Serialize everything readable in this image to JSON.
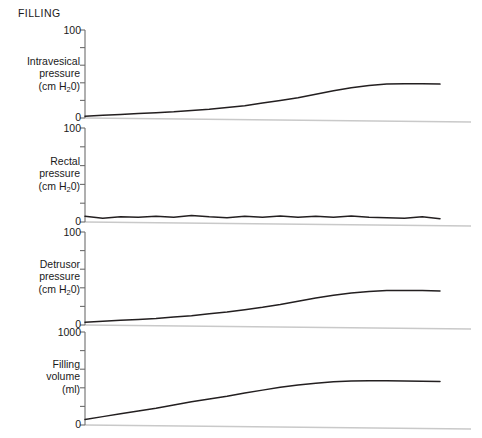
{
  "figure": {
    "phase_title": "FILLING",
    "background": "#ffffff",
    "trace_color": "#231f20",
    "baseline_color": "#c9c9c9",
    "axis_color": "#6d6d6d"
  },
  "panels": [
    {
      "id": "intravesical-pressure",
      "label_lines": [
        "Intravesical",
        "pressure",
        "(cm H₂0)"
      ],
      "unit": "cm H20",
      "axis_max_label": "100",
      "axis_min_label": "0",
      "ymin": 0,
      "ymax": 100,
      "ticks": [
        0,
        20,
        40,
        60,
        80,
        100
      ]
    },
    {
      "id": "rectal-pressure",
      "label_lines": [
        "Rectal",
        "pressure",
        "(cm H₂0)"
      ],
      "unit": "cm H20",
      "axis_max_label": "100",
      "axis_min_label": "0",
      "ymin": 0,
      "ymax": 100,
      "ticks": [
        0,
        20,
        40,
        60,
        80,
        100
      ]
    },
    {
      "id": "detrusor-pressure",
      "label_lines": [
        "Detrusor",
        "pressure",
        "(cm H₂0)"
      ],
      "unit": "cm H20",
      "axis_max_label": "100",
      "axis_min_label": "0",
      "ymin": 0,
      "ymax": 100,
      "ticks": [
        0,
        20,
        40,
        60,
        80,
        100
      ]
    },
    {
      "id": "filling-volume",
      "label_lines": [
        "Filling",
        "volume",
        "(ml)"
      ],
      "unit": "ml",
      "axis_max_label": "1000",
      "axis_min_label": "0",
      "ymin": 0,
      "ymax": 1000,
      "ticks": [
        0,
        200,
        400,
        600,
        800,
        1000
      ]
    }
  ],
  "chart_data": {
    "type": "line",
    "title": "FILLING",
    "xlabel": "",
    "grid": false,
    "legend": "none",
    "shared_x": [
      0,
      5,
      10,
      15,
      20,
      25,
      30,
      35,
      40,
      45,
      50,
      55,
      60,
      65,
      70,
      75,
      80,
      85,
      90,
      95,
      100
    ],
    "xlim": [
      0,
      100
    ],
    "subplots": [
      {
        "name": "Intravesical pressure",
        "ylabel": "Intravesical pressure (cm H20)",
        "ylim": [
          0,
          100
        ],
        "yticks": [
          0,
          20,
          40,
          60,
          80,
          100
        ],
        "series": [
          {
            "name": "Intravesical pressure",
            "values": [
              2,
              3,
              4,
              5,
              6,
              7,
              8.5,
              10,
              12,
              14,
              17,
              20,
              23,
              27,
              31,
              34.5,
              37,
              38.5,
              39,
              39,
              38.5
            ]
          }
        ]
      },
      {
        "name": "Rectal pressure",
        "ylabel": "Rectal pressure (cm H20)",
        "ylim": [
          0,
          100
        ],
        "yticks": [
          0,
          20,
          40,
          60,
          80,
          100
        ],
        "series": [
          {
            "name": "Rectal pressure",
            "values": [
              6,
              4,
              5.5,
              5,
              6,
              5,
              7,
              5.5,
              4.5,
              6,
              5,
              6.5,
              5,
              6,
              5,
              6.5,
              5,
              4.5,
              4,
              5.5,
              3.5
            ]
          }
        ]
      },
      {
        "name": "Detrusor pressure",
        "ylabel": "Detrusor pressure (cm H20)",
        "ylim": [
          0,
          100
        ],
        "yticks": [
          0,
          20,
          40,
          60,
          80,
          100
        ],
        "series": [
          {
            "name": "Detrusor pressure",
            "values": [
              3,
              4,
              5,
              6,
              7,
              8.5,
              10,
              12,
              14,
              16.5,
              19,
              22,
              25.5,
              29,
              32,
              34.5,
              36,
              37,
              37,
              37,
              36.5
            ]
          }
        ]
      },
      {
        "name": "Filling volume",
        "ylabel": "Filling volume (ml)",
        "ylim": [
          0,
          1000
        ],
        "yticks": [
          0,
          200,
          400,
          600,
          800,
          1000
        ],
        "series": [
          {
            "name": "Filling volume",
            "values": [
              60,
              90,
              120,
              150,
              180,
              215,
              250,
              280,
              310,
              345,
              375,
              405,
              430,
              450,
              465,
              472,
              475,
              475,
              473,
              470,
              468
            ]
          }
        ]
      }
    ]
  }
}
